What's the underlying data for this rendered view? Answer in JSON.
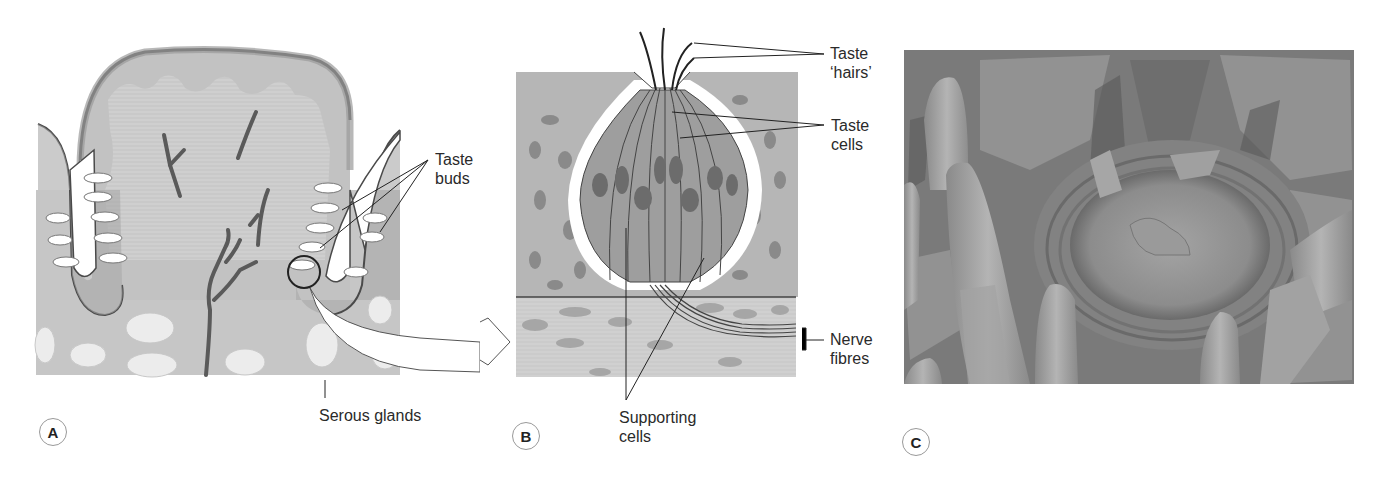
{
  "figure": {
    "panels": [
      {
        "id": "A",
        "badge": "A",
        "title": "Circumvallate papilla (section)",
        "labels": {
          "taste_buds": "Taste\nbuds",
          "serous_glands": "Serous glands"
        }
      },
      {
        "id": "B",
        "badge": "B",
        "title": "Taste bud (enlarged)",
        "labels": {
          "taste_hairs": "Taste\n‘hairs’",
          "taste_cells": "Taste\ncells",
          "nerve_fibres": "Nerve\nfibres",
          "supporting_cells": "Supporting\ncells"
        }
      },
      {
        "id": "C",
        "badge": "C",
        "title": "Scanning electron micrograph of papilla"
      }
    ],
    "colors": {
      "tissue_light": "#d4d4d4",
      "tissue_mid": "#b8b8b8",
      "tissue_dark": "#8e8e8e",
      "outline": "#4a4a4a",
      "sem_base": "#9a9a9a"
    }
  }
}
